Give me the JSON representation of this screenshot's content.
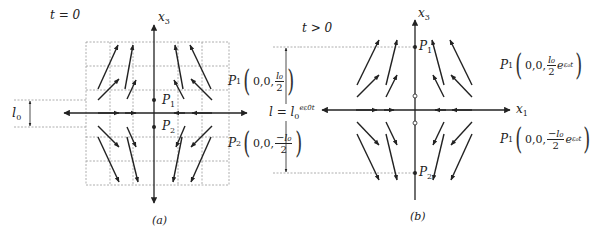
{
  "panel_a": {
    "time_label": "t = 0",
    "axis_vertical_label": "x",
    "axis_vertical_sub": "3",
    "p1_label": "P",
    "p1_sub": "1",
    "p2_label": "P",
    "p2_sub": "2",
    "dimension_label": "l",
    "dimension_sub": "0",
    "caption": "(a)",
    "coord_p1": {
      "name": "P",
      "sub": "1",
      "tuple": "0,0,",
      "num": "l₀",
      "den": "2"
    },
    "coord_p2": {
      "name": "P",
      "sub": "2",
      "tuple": "0,0,",
      "num": "−l₀",
      "den": "2"
    },
    "length_label": "l = l",
    "length_sub": "0",
    "length_sup": "eε0t"
  },
  "panel_b": {
    "time_label": "t > 0",
    "axis_vertical_label": "x",
    "axis_vertical_sub": "3",
    "axis_horizontal_label": "x",
    "axis_horizontal_sub": "1",
    "p1_label": "P",
    "p1_sub": "1",
    "p2_label": "P",
    "p2_sub": "2",
    "caption": "(b)",
    "coord_upper": {
      "name": "P",
      "sub": "1",
      "tuple": "0,0,",
      "num": "l₀",
      "den": "2",
      "exp": "e",
      "exp_sup": "ε₀t"
    },
    "coord_lower": {
      "name": "P",
      "sub": "1",
      "tuple": "0,0,",
      "num": "−l₀",
      "den": "2",
      "exp": "e",
      "exp_sup": "ε₀t"
    }
  },
  "colors": {
    "ink": "#222222",
    "grid": "#9a9a9a",
    "background": "#ffffff"
  }
}
